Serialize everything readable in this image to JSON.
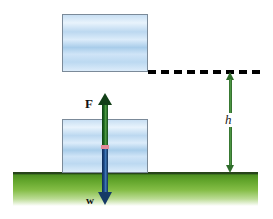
{
  "diagram": {
    "background_color": "#ffffff",
    "ground": {
      "name": "grass-ground",
      "top_line_color": "#27441a",
      "gradient_from": "#4e8f22",
      "gradient_to": "#ffffff"
    },
    "blocks": [
      {
        "id": "block-top",
        "role": "raised-block-final-position",
        "fill_top_color": "#c8dff3",
        "fill_mid_color": "#a9cdea",
        "border_color": "#7b8a99"
      },
      {
        "id": "block-bottom",
        "role": "block-initial-position-on-ground",
        "fill_top_color": "#c8dff3",
        "fill_mid_color": "#a9cdea",
        "border_color": "#7b8a99"
      }
    ],
    "dashed_line": {
      "name": "height-reference-line",
      "color": "#000000",
      "style": "dashed"
    },
    "vectors": [
      {
        "id": "force-vector",
        "label": "F",
        "meaning": "applied upward force",
        "direction": "up",
        "color": "#1f6b23"
      },
      {
        "id": "weight-vector",
        "label": "w",
        "meaning": "weight acting downward",
        "direction": "down",
        "color": "#1d4b87"
      },
      {
        "id": "height-vector",
        "label": "h",
        "meaning": "height the block is raised",
        "direction": "double",
        "color": "#2f6d2b"
      }
    ],
    "markers": [
      {
        "id": "junction-marker",
        "meaning": "point of application of the forces",
        "color": "#e58a9a"
      }
    ]
  }
}
